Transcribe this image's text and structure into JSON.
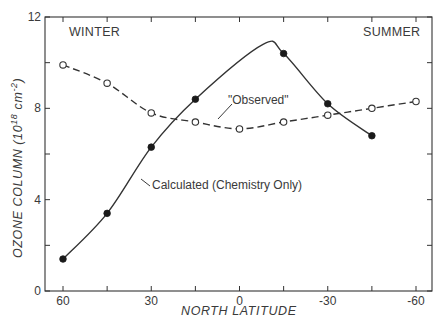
{
  "chart_data": {
    "type": "line",
    "title": "",
    "xlabel": "NORTH LATITUDE",
    "ylabel": "OZONE COLUMN (10^18 cm^-2)",
    "ylabel_parts": {
      "main": "OZONE COLUMN (10",
      "sup1": "18",
      "mid": " cm",
      "sup2": "-2",
      "end": ")"
    },
    "xlim": [
      60,
      -60
    ],
    "ylim": [
      0,
      12
    ],
    "x_ticks": [
      60,
      45,
      30,
      15,
      0,
      -15,
      -30,
      -45,
      -60
    ],
    "x_tick_labels": [
      {
        "value": 60,
        "label": "60"
      },
      {
        "value": 30,
        "label": "30"
      },
      {
        "value": 0,
        "label": "0"
      },
      {
        "value": -30,
        "label": "-30"
      },
      {
        "value": -60,
        "label": "-60"
      }
    ],
    "y_ticks": [
      0,
      2,
      4,
      6,
      8,
      10,
      12
    ],
    "y_tick_labels": [
      {
        "value": 0,
        "label": "0"
      },
      {
        "value": 4,
        "label": "4"
      },
      {
        "value": 8,
        "label": "8"
      },
      {
        "value": 12,
        "label": "12"
      }
    ],
    "grid": false,
    "legend": "inline annotations",
    "annotations": [
      {
        "text": "WINTER",
        "position": "top-left"
      },
      {
        "text": "SUMMER",
        "position": "top-right"
      },
      {
        "text": "\"Observed\"",
        "points_to": "dashed curve"
      },
      {
        "text": "Calculated (Chemistry Only)",
        "points_to": "solid curve"
      }
    ],
    "series": [
      {
        "name": "\"Observed\"",
        "style": "dashed line, open circles",
        "x": [
          60,
          45,
          30,
          15,
          0,
          -15,
          -30,
          -45,
          -60
        ],
        "values": [
          9.9,
          9.1,
          7.8,
          7.4,
          7.1,
          7.4,
          7.7,
          8.0,
          8.3
        ]
      },
      {
        "name": "Calculated (Chemistry Only)",
        "style": "solid line, filled circles",
        "x": [
          60,
          45,
          30,
          15,
          -15,
          -30,
          -45
        ],
        "values": [
          1.4,
          3.4,
          6.3,
          8.4,
          10.4,
          8.2,
          6.8
        ],
        "curve_peak": {
          "x": -8,
          "y": 10.8
        }
      }
    ]
  },
  "labels": {
    "winter": "WINTER",
    "summer": "SUMMER",
    "observed": "\"Observed\"",
    "calculated": "Calculated (Chemistry Only)"
  }
}
